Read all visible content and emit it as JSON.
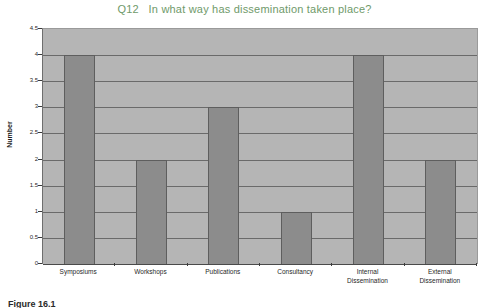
{
  "chart_data": {
    "type": "bar",
    "title": "Q12   In what way has dissemination taken place?",
    "xlabel": "",
    "ylabel": "Number",
    "categories": [
      "Symposiums",
      "Workshops",
      "Publications",
      "Consultancy",
      "Internal\nDissemination",
      "External\nDissemination"
    ],
    "values": [
      4,
      2,
      3,
      1,
      4,
      2
    ],
    "ylim": [
      0,
      4.5
    ],
    "ytick_labels": [
      "4.5",
      "4",
      "3.5",
      "3",
      "2.5",
      "2",
      "1.5",
      "1",
      "0.5",
      "0"
    ],
    "ytick_values": [
      4.5,
      4,
      3.5,
      3,
      2.5,
      2,
      1.5,
      1,
      0.5,
      0
    ],
    "grid": true,
    "legend": false,
    "colors": {
      "title": "#6f9a6a",
      "bar": "#8c8c8c",
      "bar_edge": "#5e5e5e",
      "plot_background": "#b5b5b5",
      "gridline": "#6a6a6a",
      "axis_text": "#1f1f1f",
      "page_background": "#ffffff"
    }
  },
  "caption": {
    "text": "Figure 16.1"
  }
}
